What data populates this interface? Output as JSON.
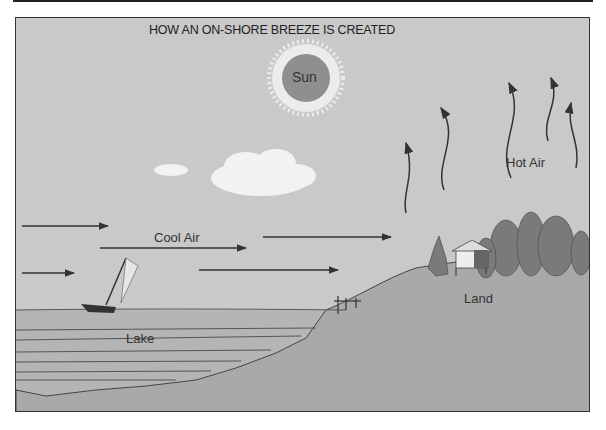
{
  "diagram": {
    "title": "HOW AN ON-SHORE BREEZE IS CREATED",
    "labels": {
      "sun": "Sun",
      "cool_air": "Cool Air",
      "hot_air": "Hot Air",
      "land": "Land",
      "lake": "Lake"
    },
    "elements": [
      "sun",
      "clouds",
      "cool-air-arrows",
      "hot-air-arrows",
      "sailboat",
      "dock",
      "house",
      "trees",
      "lake",
      "land-slope"
    ],
    "colors": {
      "sky": "#c9c9c9",
      "sun_core": "#8f8f8f",
      "sun_glow": "#ececec",
      "cloud": "#f2f2f2",
      "water": "#b5b5b5",
      "land": "#a9a9a9",
      "arrow": "#333333"
    }
  }
}
